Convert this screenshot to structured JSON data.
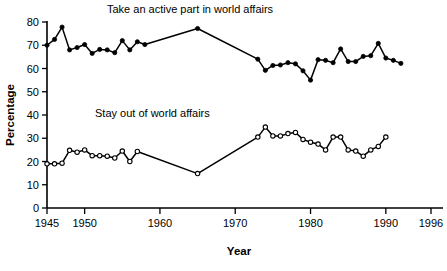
{
  "chart_data": {
    "type": "line",
    "title": "",
    "xlabel": "Year",
    "ylabel": "Percentage",
    "xlim": [
      1945,
      1996
    ],
    "ylim": [
      0,
      80
    ],
    "grid": false,
    "legend_position": "inline-annotation",
    "x_ticks": [
      1945,
      1950,
      1960,
      1970,
      1980,
      1990,
      1996
    ],
    "x_tick_labels": [
      "1945",
      "1950",
      "1960",
      "1970",
      "1980",
      "1990",
      "1996"
    ],
    "y_ticks": [
      0,
      10,
      20,
      30,
      40,
      50,
      60,
      70,
      80
    ],
    "y_tick_labels": [
      "0",
      "10",
      "20",
      "30",
      "40",
      "50",
      "60",
      "70",
      "80"
    ],
    "annotations": [
      {
        "text": "Take an active part in world affairs",
        "x": 1964,
        "y": 84,
        "series": "active"
      },
      {
        "text": "Stay out of world affairs",
        "x": 1959,
        "y": 39,
        "series": "stay-out"
      }
    ],
    "series": [
      {
        "name": "Take an active part in world affairs",
        "marker": "filled-circle",
        "points": [
          [
            1945,
            70.0
          ],
          [
            1946,
            72.5
          ],
          [
            1947,
            77.8
          ],
          [
            1948,
            68.0
          ],
          [
            1949,
            69.0
          ],
          [
            1950,
            70.3
          ],
          [
            1951,
            66.5
          ],
          [
            1952,
            68.2
          ],
          [
            1953,
            68.0
          ],
          [
            1954,
            66.8
          ],
          [
            1955,
            72.0
          ],
          [
            1956,
            68.0
          ],
          [
            1957,
            71.5
          ],
          [
            1958,
            70.3
          ],
          [
            1965,
            77.2
          ],
          [
            1973,
            64.0
          ],
          [
            1974,
            59.2
          ],
          [
            1975,
            61.3
          ],
          [
            1976,
            61.5
          ],
          [
            1977,
            62.5
          ],
          [
            1978,
            62.0
          ],
          [
            1979,
            59.0
          ],
          [
            1980,
            55.0
          ],
          [
            1981,
            63.8
          ],
          [
            1982,
            63.5
          ],
          [
            1983,
            62.5
          ],
          [
            1984,
            68.4
          ],
          [
            1985,
            63.0
          ],
          [
            1986,
            63.0
          ],
          [
            1987,
            65.2
          ],
          [
            1988,
            65.5
          ],
          [
            1989,
            70.8
          ],
          [
            1990,
            64.5
          ],
          [
            1991,
            63.5
          ],
          [
            1992,
            62.2
          ]
        ]
      },
      {
        "name": "Stay out of world affairs",
        "marker": "open-circle",
        "points": [
          [
            1945,
            19.0
          ],
          [
            1946,
            19.0
          ],
          [
            1947,
            19.3
          ],
          [
            1948,
            24.8
          ],
          [
            1949,
            24.0
          ],
          [
            1950,
            25.0
          ],
          [
            1951,
            22.5
          ],
          [
            1952,
            22.5
          ],
          [
            1953,
            22.3
          ],
          [
            1954,
            21.5
          ],
          [
            1955,
            24.5
          ],
          [
            1956,
            20.0
          ],
          [
            1957,
            24.3
          ],
          [
            1965,
            14.8
          ],
          [
            1973,
            30.5
          ],
          [
            1974,
            34.8
          ],
          [
            1975,
            31.0
          ],
          [
            1976,
            31.0
          ],
          [
            1977,
            32.0
          ],
          [
            1978,
            32.5
          ],
          [
            1979,
            29.5
          ],
          [
            1980,
            28.3
          ],
          [
            1981,
            27.5
          ],
          [
            1982,
            25.0
          ],
          [
            1983,
            30.5
          ],
          [
            1984,
            30.5
          ],
          [
            1985,
            25.0
          ],
          [
            1986,
            24.5
          ],
          [
            1987,
            22.3
          ],
          [
            1988,
            25.0
          ],
          [
            1989,
            26.5
          ],
          [
            1990,
            30.5
          ]
        ]
      }
    ]
  }
}
